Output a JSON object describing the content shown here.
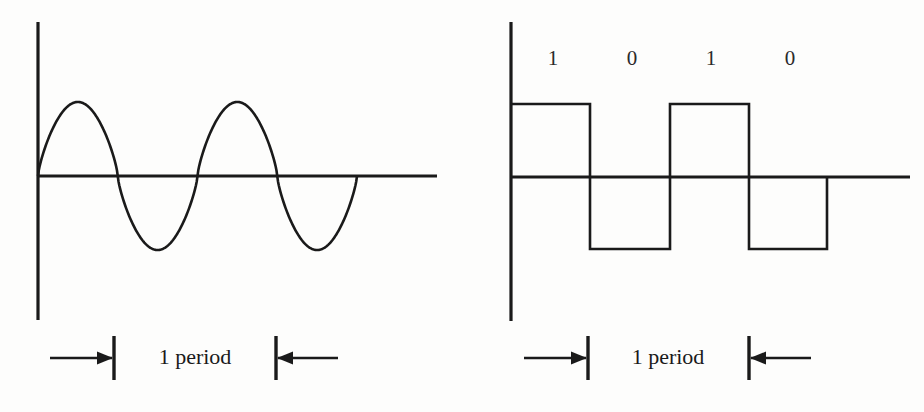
{
  "figure": {
    "background_color": "#fdfdfc",
    "ink_color": "#1a1a1a"
  },
  "panels": [
    {
      "id": "analog-panel",
      "name": "sine-wave-panel",
      "wave_type": "sine",
      "period_label": "1 period",
      "axis": {
        "x_axis_y": 176,
        "x_axis_from": 38,
        "x_axis_to": 437,
        "y_axis_x": 38,
        "y_axis_from": 22,
        "y_axis_to": 320
      },
      "wave": {
        "start_x": 38,
        "end_x": 357,
        "amplitude": 74,
        "cycles": 2,
        "peaks_x": [
          77,
          237
        ],
        "troughs_x": [
          157,
          317
        ],
        "zero_crossings_x": [
          118,
          198,
          278,
          357
        ]
      },
      "dimension": {
        "left_arrow_from_x": 50,
        "left_arrow_to_x": 114,
        "left_tick_x": 114,
        "right_tick_x": 276,
        "right_arrow_from_x": 338,
        "right_arrow_to_x": 276,
        "line_y": 358,
        "tick_top_y": 336,
        "tick_bottom_y": 380,
        "label_center_x": 195,
        "label_y": 346
      }
    },
    {
      "id": "digital-panel",
      "name": "square-wave-panel",
      "wave_type": "square",
      "period_label": "1 period",
      "bits": [
        {
          "value": "1",
          "x": 553
        },
        {
          "value": "0",
          "x": 632
        },
        {
          "value": "1",
          "x": 711
        },
        {
          "value": "0",
          "x": 790
        }
      ],
      "bits_label_y": 48,
      "axis": {
        "x_axis_y": 177,
        "x_axis_from": 511,
        "x_axis_to": 910,
        "y_axis_x": 511,
        "y_axis_from": 22,
        "y_axis_to": 321
      },
      "wave": {
        "high_y": 104,
        "low_y": 249,
        "zero_y": 177,
        "transitions_x": [
          511,
          590,
          670,
          749,
          827
        ],
        "levels": [
          "high",
          "low",
          "high",
          "low"
        ],
        "end_x": 827
      },
      "dimension": {
        "left_arrow_from_x": 524,
        "left_arrow_to_x": 588,
        "left_tick_x": 588,
        "right_tick_x": 749,
        "right_arrow_from_x": 811,
        "right_arrow_to_x": 749,
        "line_y": 358,
        "tick_top_y": 336,
        "tick_bottom_y": 380,
        "label_center_x": 668,
        "label_y": 346
      }
    }
  ]
}
